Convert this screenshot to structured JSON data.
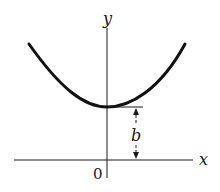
{
  "diagram": {
    "type": "function-graph",
    "labels": {
      "y_axis": "y",
      "x_axis": "x",
      "origin": "0",
      "height": "b"
    },
    "colors": {
      "ink": "#1a1a1a",
      "background": "#ffffff"
    }
  }
}
